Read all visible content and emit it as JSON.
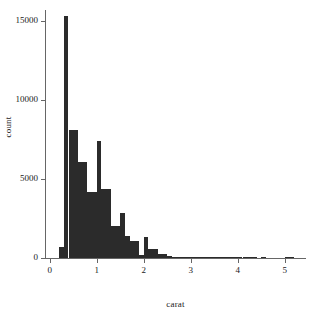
{
  "chart_data": {
    "type": "bar",
    "title": "",
    "subtitle": "",
    "xlabel": "carat",
    "ylabel": "count",
    "xlim": [
      -0.1,
      5.45
    ],
    "ylim": [
      0,
      15700
    ],
    "grid": false,
    "legend": null,
    "bin_width": 0.1,
    "x_ticks": [
      0,
      1,
      2,
      3,
      4,
      5
    ],
    "x_tick_labels": [
      "0",
      "1",
      "2",
      "3",
      "4",
      "5"
    ],
    "y_ticks": [
      0,
      5000,
      10000,
      15000
    ],
    "y_tick_labels": [
      "0",
      "5000",
      "10000",
      "15000"
    ],
    "bar_color": "#2b2b2b",
    "axis_color": "#666666",
    "bins": [
      {
        "x": 0.2,
        "value": 700
      },
      {
        "x": 0.3,
        "value": 15300
      },
      {
        "x": 0.4,
        "value": 8100
      },
      {
        "x": 0.5,
        "value": 8100
      },
      {
        "x": 0.6,
        "value": 6100
      },
      {
        "x": 0.7,
        "value": 6100
      },
      {
        "x": 0.8,
        "value": 4200
      },
      {
        "x": 0.9,
        "value": 4200
      },
      {
        "x": 1.0,
        "value": 7400
      },
      {
        "x": 1.1,
        "value": 4400
      },
      {
        "x": 1.2,
        "value": 4400
      },
      {
        "x": 1.3,
        "value": 2050
      },
      {
        "x": 1.4,
        "value": 2050
      },
      {
        "x": 1.5,
        "value": 2850
      },
      {
        "x": 1.6,
        "value": 1400
      },
      {
        "x": 1.7,
        "value": 1050
      },
      {
        "x": 1.8,
        "value": 1050
      },
      {
        "x": 1.9,
        "value": 200
      },
      {
        "x": 2.0,
        "value": 1350
      },
      {
        "x": 2.1,
        "value": 550
      },
      {
        "x": 2.2,
        "value": 550
      },
      {
        "x": 2.3,
        "value": 280
      },
      {
        "x": 2.4,
        "value": 280
      },
      {
        "x": 2.5,
        "value": 120
      },
      {
        "x": 2.6,
        "value": 70
      },
      {
        "x": 2.7,
        "value": 40
      },
      {
        "x": 2.8,
        "value": 25
      },
      {
        "x": 2.9,
        "value": 20
      },
      {
        "x": 3.0,
        "value": 30
      },
      {
        "x": 3.1,
        "value": 12
      },
      {
        "x": 3.2,
        "value": 10
      },
      {
        "x": 3.3,
        "value": 8
      },
      {
        "x": 3.4,
        "value": 6
      },
      {
        "x": 3.5,
        "value": 14
      },
      {
        "x": 3.6,
        "value": 4
      },
      {
        "x": 3.7,
        "value": 4
      },
      {
        "x": 3.8,
        "value": 3
      },
      {
        "x": 3.9,
        "value": 3
      },
      {
        "x": 4.0,
        "value": 6
      },
      {
        "x": 4.1,
        "value": 3
      },
      {
        "x": 4.2,
        "value": 2
      },
      {
        "x": 4.3,
        "value": 2
      },
      {
        "x": 4.5,
        "value": 4
      },
      {
        "x": 5.0,
        "value": 4
      },
      {
        "x": 5.1,
        "value": 3
      }
    ]
  }
}
